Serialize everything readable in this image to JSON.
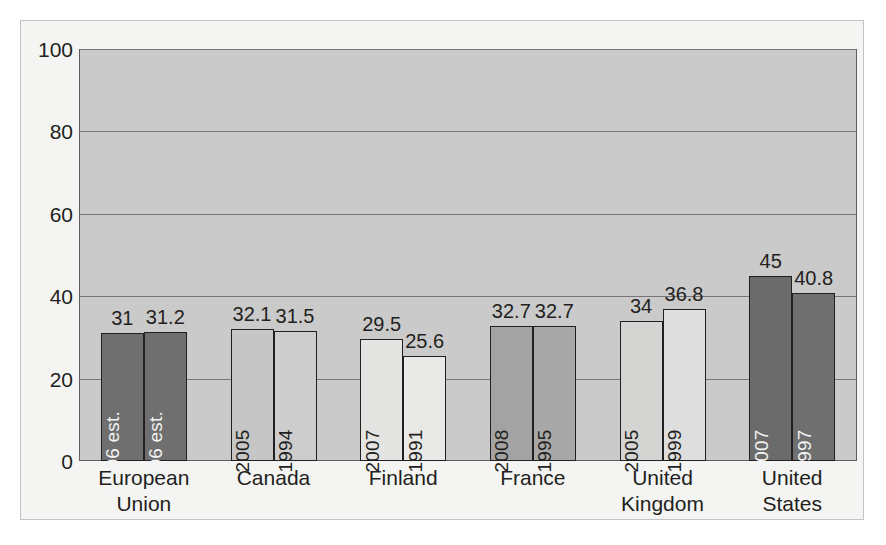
{
  "chart_data": {
    "type": "bar",
    "title": "",
    "subtitle": "",
    "xlabel": "",
    "ylabel": "",
    "ylim": [
      0,
      100
    ],
    "yticks": [
      "0",
      "20",
      "40",
      "60",
      "80",
      "100"
    ],
    "grid": true,
    "legend": "none",
    "categories": [
      "European Union",
      "Canada",
      "Finland",
      "France",
      "United Kingdom",
      "United States"
    ],
    "category_lines": [
      [
        "European",
        "Union"
      ],
      [
        "Canada",
        ""
      ],
      [
        "Finland",
        ""
      ],
      [
        "France",
        ""
      ],
      [
        "United",
        "Kingdom"
      ],
      [
        "United",
        "States"
      ]
    ],
    "groups": [
      {
        "category": "European Union",
        "bars": [
          {
            "label": "2006 est.",
            "value": 31,
            "value_text": "31",
            "fill": "#6f6f6f",
            "text_tone": "light"
          },
          {
            "label": "1996 est.",
            "value": 31.2,
            "value_text": "31.2",
            "fill": "#6f6f6f",
            "text_tone": "light"
          }
        ]
      },
      {
        "category": "Canada",
        "bars": [
          {
            "label": "2005",
            "value": 32.1,
            "value_text": "32.1",
            "fill": "#c6c6c6",
            "text_tone": "dark"
          },
          {
            "label": "1994",
            "value": 31.5,
            "value_text": "31.5",
            "fill": "#cdcdcd",
            "text_tone": "dark"
          }
        ]
      },
      {
        "category": "Finland",
        "bars": [
          {
            "label": "2007",
            "value": 29.5,
            "value_text": "29.5",
            "fill": "#e4e4e2",
            "text_tone": "dark"
          },
          {
            "label": "1991",
            "value": 25.6,
            "value_text": "25.6",
            "fill": "#e9e9e7",
            "text_tone": "dark"
          }
        ]
      },
      {
        "category": "France",
        "bars": [
          {
            "label": "2008",
            "value": 32.7,
            "value_text": "32.7",
            "fill": "#a3a3a3",
            "text_tone": "dark"
          },
          {
            "label": "1995",
            "value": 32.7,
            "value_text": "32.7",
            "fill": "#a8a8a8",
            "text_tone": "dark"
          }
        ]
      },
      {
        "category": "United Kingdom",
        "bars": [
          {
            "label": "2005",
            "value": 34,
            "value_text": "34",
            "fill": "#d4d4d3",
            "text_tone": "dark"
          },
          {
            "label": "1999",
            "value": 36.8,
            "value_text": "36.8",
            "fill": "#dedede",
            "text_tone": "dark"
          }
        ]
      },
      {
        "category": "United States",
        "bars": [
          {
            "label": "2007",
            "value": 45,
            "value_text": "45",
            "fill": "#6b6b6b",
            "text_tone": "light"
          },
          {
            "label": "1997",
            "value": 40.8,
            "value_text": "40.8",
            "fill": "#6f6f6f",
            "text_tone": "light"
          }
        ]
      }
    ]
  }
}
